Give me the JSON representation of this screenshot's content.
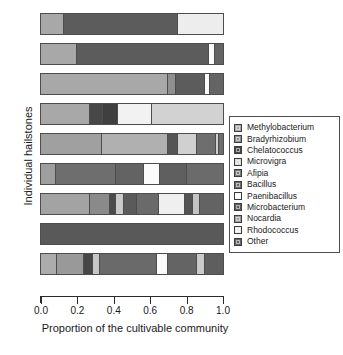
{
  "chart_data": {
    "type": "bar",
    "orientation": "horizontal",
    "stacked": true,
    "title": "",
    "xlabel": "Proportion of the cultivable community",
    "ylabel": "Individual hailstones",
    "xlim": [
      0,
      1
    ],
    "xticks": [
      "0.0",
      "0.2",
      "0.4",
      "0.6",
      "0.8",
      "1.0"
    ],
    "xtick_values": [
      0.0,
      0.2,
      0.4,
      0.6,
      0.8,
      1.0
    ],
    "grid": false,
    "legend_position": "right",
    "categories": [
      "Hailstone 1",
      "Hailstone 2",
      "Hailstone 3",
      "Hailstone 4",
      "Hailstone 5",
      "Hailstone 6",
      "Hailstone 7",
      "Hailstone 8",
      "Hailstone 9"
    ],
    "legend": [
      {
        "label": "Methylobacterium",
        "color": "#a8a8a8"
      },
      {
        "label": "Bradyrhizobium",
        "color": "#8f8f8f"
      },
      {
        "label": "Chelatococcus",
        "color": "#474747"
      },
      {
        "label": "Microvigra",
        "color": "#d9d9d9"
      },
      {
        "label": "Afipia",
        "color": "#7a7a7a"
      },
      {
        "label": "Bacillus",
        "color": "#6b6b6b"
      },
      {
        "label": "Paenibacillus",
        "color": "#fbfbfb"
      },
      {
        "label": "Microbacterium",
        "color": "#5c5c5c"
      },
      {
        "label": "Nocardia",
        "color": "#9c9c9c"
      },
      {
        "label": "Rhodococcus",
        "color": "#ededed"
      },
      {
        "label": "Other",
        "color": "#646464"
      }
    ],
    "series": [
      {
        "name": "Methylobacterium",
        "values": [
          0.125,
          0.2,
          0.7,
          0.27,
          0.335,
          0.085,
          0.27,
          0.0,
          0.09
        ]
      },
      {
        "name": "Bradyrhizobium",
        "values": [
          0.0,
          0.0,
          0.04,
          0.0,
          0.0,
          0.0,
          0.11,
          0.0,
          0.145
        ]
      },
      {
        "name": "Chelatococcus",
        "values": [
          0.0,
          0.0,
          0.0,
          0.07,
          0.0,
          0.0,
          0.03,
          0.0,
          0.05
        ]
      },
      {
        "name": "Microvigra",
        "values": [
          0.0,
          0.0,
          0.0,
          0.0,
          0.1,
          0.0,
          0.045,
          0.0,
          0.04
        ]
      },
      {
        "name": "Afipia",
        "values": [
          0.0,
          0.0,
          0.0,
          0.085,
          0.0,
          0.0,
          0.075,
          0.0,
          0.0
        ]
      },
      {
        "name": "Bacillus",
        "values": [
          0.0,
          0.0,
          0.0,
          0.0,
          0.365,
          0.325,
          0.0,
          0.0,
          0.0
        ]
      },
      {
        "name": "Paenibacillus",
        "values": [
          0.0,
          0.03,
          0.03,
          0.0,
          0.0,
          0.09,
          0.0,
          0.0,
          0.06
        ]
      },
      {
        "name": "Microbacterium",
        "values": [
          0.63,
          0.725,
          0.16,
          0.0,
          0.055,
          0.155,
          0.12,
          1.0,
          0.315
        ]
      },
      {
        "name": "Nocardia",
        "values": [
          0.0,
          0.0,
          0.0,
          0.0,
          0.02,
          0.0,
          0.04,
          0.0,
          0.045
        ]
      },
      {
        "name": "Rhodococcus",
        "values": [
          0.245,
          0.0,
          0.0,
          0.185,
          0.0,
          0.0,
          0.14,
          0.0,
          0.0
        ]
      },
      {
        "name": "Other",
        "values": [
          0.0,
          0.045,
          0.07,
          0.39,
          0.125,
          0.345,
          0.17,
          0.0,
          0.255
        ]
      }
    ],
    "bars": [
      {
        "name": "Hailstone 1",
        "segments": [
          {
            "label": "Methylobacterium",
            "value": 0.125,
            "color": "#a8a8a8"
          },
          {
            "label": "Microbacterium",
            "value": 0.63,
            "color": "#5c5c5c"
          },
          {
            "label": "Rhodococcus",
            "value": 0.245,
            "color": "#ededed"
          }
        ]
      },
      {
        "name": "Hailstone 2",
        "segments": [
          {
            "label": "Methylobacterium",
            "value": 0.2,
            "color": "#a8a8a8"
          },
          {
            "label": "Microbacterium",
            "value": 0.725,
            "color": "#5c5c5c"
          },
          {
            "label": "Paenibacillus",
            "value": 0.03,
            "color": "#fbfbfb"
          },
          {
            "label": "Other",
            "value": 0.045,
            "color": "#646464"
          }
        ]
      },
      {
        "name": "Hailstone 3",
        "segments": [
          {
            "label": "Methylobacterium",
            "value": 0.7,
            "color": "#a8a8a8"
          },
          {
            "label": "Bradyrhizobium",
            "value": 0.04,
            "color": "#8f8f8f"
          },
          {
            "label": "Microbacterium",
            "value": 0.16,
            "color": "#5c5c5c"
          },
          {
            "label": "Paenibacillus",
            "value": 0.03,
            "color": "#fbfbfb"
          },
          {
            "label": "Other",
            "value": 0.07,
            "color": "#646464"
          }
        ]
      },
      {
        "name": "Hailstone 4",
        "segments": [
          {
            "label": "Methylobacterium",
            "value": 0.27,
            "color": "#a8a8a8"
          },
          {
            "label": "Chelatococcus",
            "value": 0.07,
            "color": "#474747"
          },
          {
            "label": "Afipia",
            "value": 0.085,
            "color": "#3f3f3f"
          },
          {
            "label": "Rhodococcus",
            "value": 0.185,
            "color": "#f2f2f2"
          },
          {
            "label": "Other",
            "value": 0.39,
            "color": "#d2d2d2"
          }
        ]
      },
      {
        "name": "Hailstone 5",
        "segments": [
          {
            "label": "Methylobacterium",
            "value": 0.335,
            "color": "#a0a0a0"
          },
          {
            "label": "Bacillus",
            "value": 0.365,
            "color": "#b0b0b0"
          },
          {
            "label": "Microbacterium",
            "value": 0.055,
            "color": "#555555"
          },
          {
            "label": "Microvigra",
            "value": 0.1,
            "color": "#d0d0d0"
          },
          {
            "label": "Other",
            "value": 0.105,
            "color": "#6e6e6e"
          },
          {
            "label": "Nocardia",
            "value": 0.02,
            "color": "#cfcfcf"
          },
          {
            "label": "Other",
            "value": 0.02,
            "color": "#6e6e6e"
          }
        ]
      },
      {
        "name": "Hailstone 6",
        "segments": [
          {
            "label": "Methylobacterium",
            "value": 0.085,
            "color": "#9e9e9e"
          },
          {
            "label": "Bacillus",
            "value": 0.325,
            "color": "#6e6e6e"
          },
          {
            "label": "Microbacterium",
            "value": 0.155,
            "color": "#636363"
          },
          {
            "label": "Paenibacillus",
            "value": 0.09,
            "color": "#fbfbfb"
          },
          {
            "label": "Other",
            "value": 0.145,
            "color": "#5f5f5f"
          },
          {
            "label": "Other",
            "value": 0.2,
            "color": "#6b6b6b"
          }
        ]
      },
      {
        "name": "Hailstone 7",
        "segments": [
          {
            "label": "Methylobacterium",
            "value": 0.27,
            "color": "#a3a3a3"
          },
          {
            "label": "Bradyrhizobium",
            "value": 0.11,
            "color": "#8a8a8a"
          },
          {
            "label": "Chelatococcus",
            "value": 0.03,
            "color": "#4a4a4a"
          },
          {
            "label": "Microvigra",
            "value": 0.045,
            "color": "#c9c9c9"
          },
          {
            "label": "Afipia",
            "value": 0.075,
            "color": "#5a5a5a"
          },
          {
            "label": "Microbacterium",
            "value": 0.12,
            "color": "#6a6a6a"
          },
          {
            "label": "Rhodococcus",
            "value": 0.14,
            "color": "#efefef"
          },
          {
            "label": "Other",
            "value": 0.045,
            "color": "#525252"
          },
          {
            "label": "Nocardia",
            "value": 0.04,
            "color": "#c4c4c4"
          },
          {
            "label": "Other",
            "value": 0.125,
            "color": "#636363"
          }
        ]
      },
      {
        "name": "Hailstone 8",
        "segments": [
          {
            "label": "Microbacterium",
            "value": 1.0,
            "color": "#595959"
          }
        ]
      },
      {
        "name": "Hailstone 9",
        "segments": [
          {
            "label": "Methylobacterium",
            "value": 0.09,
            "color": "#acacac"
          },
          {
            "label": "Bradyrhizobium",
            "value": 0.145,
            "color": "#999999"
          },
          {
            "label": "Chelatococcus",
            "value": 0.05,
            "color": "#464646"
          },
          {
            "label": "Microvigra",
            "value": 0.04,
            "color": "#c6c6c6"
          },
          {
            "label": "Microbacterium",
            "value": 0.315,
            "color": "#6a6a6a"
          },
          {
            "label": "Paenibacillus",
            "value": 0.06,
            "color": "#fafafa"
          },
          {
            "label": "Other",
            "value": 0.155,
            "color": "#646464"
          },
          {
            "label": "Nocardia",
            "value": 0.045,
            "color": "#cacaca"
          },
          {
            "label": "Other",
            "value": 0.1,
            "color": "#5e5e5e"
          }
        ]
      }
    ]
  }
}
